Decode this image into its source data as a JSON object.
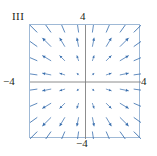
{
  "figure": {
    "label": "III",
    "panel_index": "III"
  },
  "axes": {
    "top_label": "4",
    "left_label": "−4",
    "right_label": "4",
    "bottom_label": "−4",
    "axis_color": "#808080",
    "frame_color": "#9fb9d6"
  },
  "chart_data": {
    "type": "scatter",
    "plot_kind": "vector-field",
    "title": "III",
    "xlabel": "",
    "ylabel": "",
    "xlim": [
      -4,
      4
    ],
    "ylim": [
      -4,
      4
    ],
    "xticks": [
      -4,
      4
    ],
    "yticks": [
      -4,
      4
    ],
    "xtick_labels": [
      "−4",
      "4"
    ],
    "ytick_labels": [
      "−4",
      "4"
    ],
    "grid": false,
    "legend": null,
    "arrow_color": "#3a6fae",
    "grid_columns": 8,
    "grid_rows": 8,
    "sample_x": [
      -3.5,
      -2.5,
      -1.5,
      -0.5,
      0.5,
      1.5,
      2.5,
      3.5
    ],
    "sample_y": [
      3.5,
      2.5,
      1.5,
      0.5,
      -0.5,
      -1.5,
      -2.5,
      -3.5
    ],
    "vector_rule": "u = x, v = y",
    "vectors": [
      {
        "x": -3.5,
        "y": 3.5,
        "u": -3.5,
        "v": 3.5
      },
      {
        "x": -2.5,
        "y": 3.5,
        "u": -2.5,
        "v": 3.5
      },
      {
        "x": -1.5,
        "y": 3.5,
        "u": -1.5,
        "v": 3.5
      },
      {
        "x": -0.5,
        "y": 3.5,
        "u": -0.5,
        "v": 3.5
      },
      {
        "x": 0.5,
        "y": 3.5,
        "u": 0.5,
        "v": 3.5
      },
      {
        "x": 1.5,
        "y": 3.5,
        "u": 1.5,
        "v": 3.5
      },
      {
        "x": 2.5,
        "y": 3.5,
        "u": 2.5,
        "v": 3.5
      },
      {
        "x": 3.5,
        "y": 3.5,
        "u": 3.5,
        "v": 3.5
      },
      {
        "x": -3.5,
        "y": 2.5,
        "u": -3.5,
        "v": 2.5
      },
      {
        "x": -2.5,
        "y": 2.5,
        "u": -2.5,
        "v": 2.5
      },
      {
        "x": -1.5,
        "y": 2.5,
        "u": -1.5,
        "v": 2.5
      },
      {
        "x": -0.5,
        "y": 2.5,
        "u": -0.5,
        "v": 2.5
      },
      {
        "x": 0.5,
        "y": 2.5,
        "u": 0.5,
        "v": 2.5
      },
      {
        "x": 1.5,
        "y": 2.5,
        "u": 1.5,
        "v": 2.5
      },
      {
        "x": 2.5,
        "y": 2.5,
        "u": 2.5,
        "v": 2.5
      },
      {
        "x": 3.5,
        "y": 2.5,
        "u": 3.5,
        "v": 2.5
      },
      {
        "x": -3.5,
        "y": 1.5,
        "u": -3.5,
        "v": 1.5
      },
      {
        "x": -2.5,
        "y": 1.5,
        "u": -2.5,
        "v": 1.5
      },
      {
        "x": -1.5,
        "y": 1.5,
        "u": -1.5,
        "v": 1.5
      },
      {
        "x": -0.5,
        "y": 1.5,
        "u": -0.5,
        "v": 1.5
      },
      {
        "x": 0.5,
        "y": 1.5,
        "u": 0.5,
        "v": 1.5
      },
      {
        "x": 1.5,
        "y": 1.5,
        "u": 1.5,
        "v": 1.5
      },
      {
        "x": 2.5,
        "y": 1.5,
        "u": 2.5,
        "v": 1.5
      },
      {
        "x": 3.5,
        "y": 1.5,
        "u": 3.5,
        "v": 1.5
      },
      {
        "x": -3.5,
        "y": 0.5,
        "u": -3.5,
        "v": 0.5
      },
      {
        "x": -2.5,
        "y": 0.5,
        "u": -2.5,
        "v": 0.5
      },
      {
        "x": -1.5,
        "y": 0.5,
        "u": -1.5,
        "v": 0.5
      },
      {
        "x": -0.5,
        "y": 0.5,
        "u": -0.5,
        "v": 0.5
      },
      {
        "x": 0.5,
        "y": 0.5,
        "u": 0.5,
        "v": 0.5
      },
      {
        "x": 1.5,
        "y": 0.5,
        "u": 1.5,
        "v": 0.5
      },
      {
        "x": 2.5,
        "y": 0.5,
        "u": 2.5,
        "v": 0.5
      },
      {
        "x": 3.5,
        "y": 0.5,
        "u": 3.5,
        "v": 0.5
      },
      {
        "x": -3.5,
        "y": -0.5,
        "u": -3.5,
        "v": -0.5
      },
      {
        "x": -2.5,
        "y": -0.5,
        "u": -2.5,
        "v": -0.5
      },
      {
        "x": -1.5,
        "y": -0.5,
        "u": -1.5,
        "v": -0.5
      },
      {
        "x": -0.5,
        "y": -0.5,
        "u": -0.5,
        "v": -0.5
      },
      {
        "x": 0.5,
        "y": -0.5,
        "u": 0.5,
        "v": -0.5
      },
      {
        "x": 1.5,
        "y": -0.5,
        "u": 1.5,
        "v": -0.5
      },
      {
        "x": 2.5,
        "y": -0.5,
        "u": 2.5,
        "v": -0.5
      },
      {
        "x": 3.5,
        "y": -0.5,
        "u": 3.5,
        "v": -0.5
      },
      {
        "x": -3.5,
        "y": -1.5,
        "u": -3.5,
        "v": -1.5
      },
      {
        "x": -2.5,
        "y": -1.5,
        "u": -2.5,
        "v": -1.5
      },
      {
        "x": -1.5,
        "y": -1.5,
        "u": -1.5,
        "v": -1.5
      },
      {
        "x": -0.5,
        "y": -1.5,
        "u": -0.5,
        "v": -1.5
      },
      {
        "x": 0.5,
        "y": -1.5,
        "u": 0.5,
        "v": -1.5
      },
      {
        "x": 1.5,
        "y": -1.5,
        "u": 1.5,
        "v": -1.5
      },
      {
        "x": 2.5,
        "y": -1.5,
        "u": 2.5,
        "v": -1.5
      },
      {
        "x": 3.5,
        "y": -1.5,
        "u": 3.5,
        "v": -1.5
      },
      {
        "x": -3.5,
        "y": -2.5,
        "u": -3.5,
        "v": -2.5
      },
      {
        "x": -2.5,
        "y": -2.5,
        "u": -2.5,
        "v": -2.5
      },
      {
        "x": -1.5,
        "y": -2.5,
        "u": -1.5,
        "v": -2.5
      },
      {
        "x": -0.5,
        "y": -2.5,
        "u": -0.5,
        "v": -2.5
      },
      {
        "x": 0.5,
        "y": -2.5,
        "u": 0.5,
        "v": -2.5
      },
      {
        "x": 1.5,
        "y": -2.5,
        "u": 1.5,
        "v": -2.5
      },
      {
        "x": 2.5,
        "y": -2.5,
        "u": 2.5,
        "v": -2.5
      },
      {
        "x": 3.5,
        "y": -2.5,
        "u": 3.5,
        "v": -2.5
      },
      {
        "x": -3.5,
        "y": -3.5,
        "u": -3.5,
        "v": -3.5
      },
      {
        "x": -2.5,
        "y": -3.5,
        "u": -2.5,
        "v": -3.5
      },
      {
        "x": -1.5,
        "y": -3.5,
        "u": -1.5,
        "v": -3.5
      },
      {
        "x": -0.5,
        "y": -3.5,
        "u": -0.5,
        "v": -3.5
      },
      {
        "x": 0.5,
        "y": -3.5,
        "u": 0.5,
        "v": -3.5
      },
      {
        "x": 1.5,
        "y": -3.5,
        "u": 1.5,
        "v": -3.5
      },
      {
        "x": 2.5,
        "y": -3.5,
        "u": 2.5,
        "v": -3.5
      },
      {
        "x": 3.5,
        "y": -3.5,
        "u": 3.5,
        "v": -3.5
      }
    ]
  }
}
